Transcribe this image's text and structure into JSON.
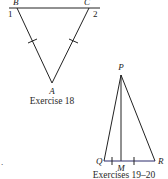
{
  "figures": [
    {
      "caption": "Exercise 18",
      "points": {
        "B": "B",
        "C": "C",
        "A": "A"
      },
      "angle_labels": {
        "one": "1",
        "two": "2"
      },
      "congruence_marks": [
        "AB",
        "AC"
      ]
    },
    {
      "caption": "Exercises 19–20",
      "points": {
        "P": "P",
        "Q": "Q",
        "R": "R",
        "M": "M"
      },
      "congruence_marks": [
        "QM",
        "MR"
      ]
    }
  ],
  "stray_mark": "."
}
